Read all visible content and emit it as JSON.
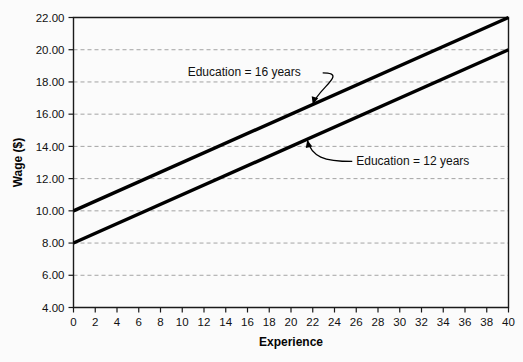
{
  "chart_data": {
    "type": "line",
    "title": "",
    "xlabel": "Experience",
    "ylabel": "Wage ($)",
    "xlim": [
      0,
      40
    ],
    "ylim": [
      4.0,
      22.0
    ],
    "grid": true,
    "grid_axis": "y",
    "legend": "none",
    "x_ticks": [
      0,
      2,
      4,
      6,
      8,
      10,
      12,
      14,
      16,
      18,
      20,
      22,
      24,
      26,
      28,
      30,
      32,
      34,
      36,
      38,
      40
    ],
    "x_tick_labels": [
      "0",
      "2",
      "4",
      "6",
      "8",
      "10",
      "12",
      "14",
      "16",
      "18",
      "20",
      "22",
      "24",
      "26",
      "28",
      "30",
      "32",
      "34",
      "36",
      "38",
      "40"
    ],
    "y_ticks": [
      4.0,
      6.0,
      8.0,
      10.0,
      12.0,
      14.0,
      16.0,
      18.0,
      20.0,
      22.0
    ],
    "y_tick_labels": [
      "4.00",
      "6.00",
      "8.00",
      "10.00",
      "12.00",
      "14.00",
      "16.00",
      "18.00",
      "20.00",
      "22.00"
    ],
    "series": [
      {
        "name": "Education = 16 years",
        "x": [
          0,
          40
        ],
        "values": [
          10.0,
          22.0
        ],
        "intercept": 10.0,
        "slope": 0.3,
        "color": "#000000"
      },
      {
        "name": "Education = 12 years",
        "x": [
          0,
          40
        ],
        "values": [
          8.0,
          20.0
        ],
        "intercept": 8.0,
        "slope": 0.3,
        "color": "#000000"
      }
    ],
    "annotations": [
      {
        "text": "Education = 16 years",
        "target_x": 22.0,
        "target_y": 16.6,
        "label_x": 10.5,
        "label_y": 18.6
      },
      {
        "text": "Education = 12 years",
        "target_x": 21.5,
        "target_y": 14.4,
        "label_x": 26.0,
        "label_y": 13.1
      }
    ]
  },
  "axes": {
    "x_title": "Experience",
    "y_title": "Wage ($)"
  }
}
